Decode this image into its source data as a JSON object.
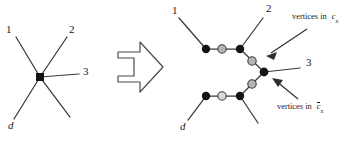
{
  "figure": {
    "name": "star-to-tree-transformation-diagram",
    "colors": {
      "edge": "#3a3a3a",
      "node_filled": "#141414",
      "node_hollow": "#b4b4b4",
      "node_hollow_stroke": "#3c3c3c",
      "text": "#171717",
      "arrow_outline": "#4a4a4a",
      "background": "#ffffff"
    },
    "left_graph": {
      "name": "star-graph",
      "center_node": {
        "shape": "square",
        "fill": "filled",
        "x": 40,
        "y": 77
      },
      "edge_labels": [
        {
          "id": "edge-label-1",
          "text": "1",
          "x": 6,
          "y": 30
        },
        {
          "id": "edge-label-2",
          "text": "2",
          "x": 69,
          "y": 30
        },
        {
          "id": "edge-label-3",
          "text": "3",
          "x": 82,
          "y": 71
        },
        {
          "id": "edge-label-d",
          "text": "d",
          "x": 8,
          "y": 124,
          "italic": true
        }
      ]
    },
    "arrow_glyph": {
      "name": "transformation-arrow",
      "direction": "right"
    },
    "right_graph": {
      "name": "expanded-tree-graph",
      "edge_labels": [
        {
          "id": "edge-label-1",
          "text": "1",
          "x": 172,
          "y": 11
        },
        {
          "id": "edge-label-2",
          "text": "2",
          "x": 265,
          "y": 9
        },
        {
          "id": "edge-label-3",
          "text": "3",
          "x": 305,
          "y": 62
        },
        {
          "id": "edge-label-d",
          "text": "d",
          "x": 183,
          "y": 126,
          "italic": true
        }
      ],
      "annotations": [
        {
          "id": "annotation-cx",
          "prefix": "vertices in",
          "symbol": "c",
          "subscript": "x",
          "overbar": false,
          "x": 292,
          "y": 17
        },
        {
          "id": "annotation-cx-complement",
          "prefix": "vertices in",
          "symbol": "c",
          "subscript": "x",
          "overbar": true,
          "x": 277,
          "y": 107
        }
      ]
    }
  }
}
